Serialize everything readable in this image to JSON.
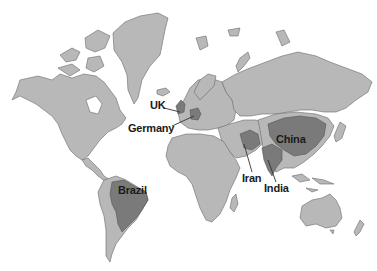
{
  "map": {
    "title": "",
    "background_color": "#ffffff",
    "land_color": "#b8b8b8",
    "highlight_color": "#7a7a7a",
    "border_color": "#6a6a6a",
    "highlighted_countries": [
      {
        "name": "UK",
        "label": "UK"
      },
      {
        "name": "Germany",
        "label": "Germany"
      },
      {
        "name": "China",
        "label": "China"
      },
      {
        "name": "Iran",
        "label": "Iran"
      },
      {
        "name": "India",
        "label": "India"
      },
      {
        "name": "Brazil",
        "label": "Brazil"
      }
    ]
  }
}
